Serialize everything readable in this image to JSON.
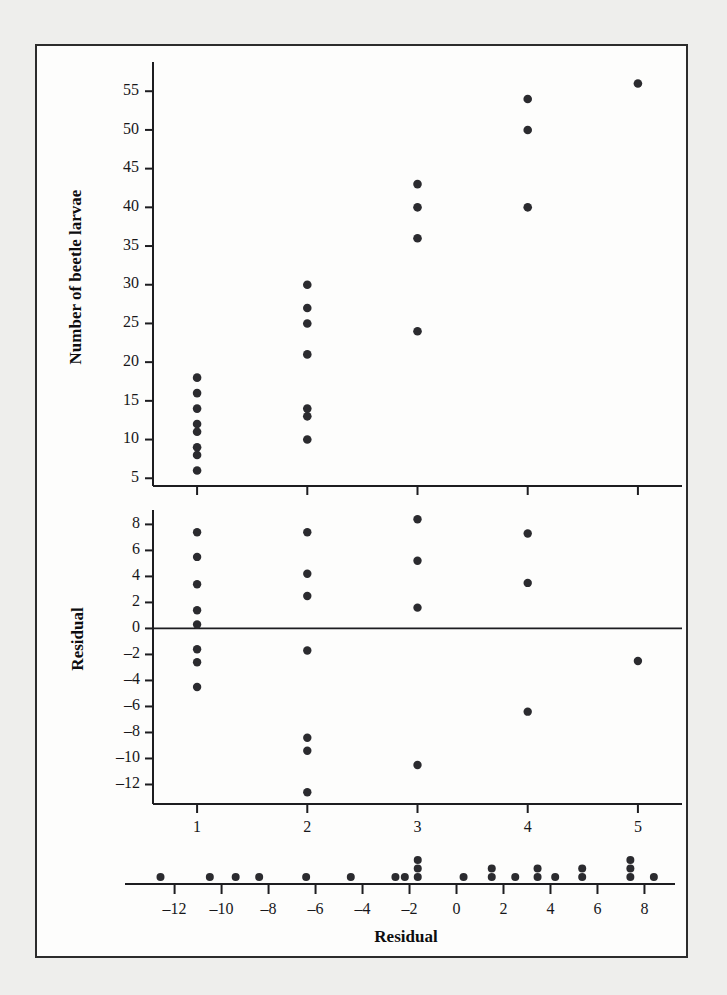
{
  "figure": {
    "background_color": "#eeeeec",
    "panel_color": "#fdfdfc",
    "border_color": "#2c2c2c",
    "marker_color": "#2b2b2f"
  },
  "chart_data": [
    {
      "type": "scatter",
      "title": "",
      "xlabel": "Number of stumps",
      "ylabel": "Number of beetle larvae",
      "xlim": [
        0.6,
        5.4
      ],
      "ylim": [
        4,
        58
      ],
      "xticks": [
        1,
        2,
        3,
        4,
        5
      ],
      "xticklabels": [
        "1",
        "2",
        "3",
        "4",
        "5"
      ],
      "yticks": [
        5,
        10,
        15,
        20,
        25,
        30,
        35,
        40,
        45,
        50,
        55
      ],
      "yticklabels": [
        "5",
        "10",
        "15",
        "20",
        "25",
        "30",
        "35",
        "40",
        "45",
        "50",
        "55"
      ],
      "grid": false,
      "legend": "none",
      "points": [
        {
          "x": 1,
          "y": 18
        },
        {
          "x": 1,
          "y": 16
        },
        {
          "x": 1,
          "y": 14
        },
        {
          "x": 1,
          "y": 12
        },
        {
          "x": 1,
          "y": 11
        },
        {
          "x": 1,
          "y": 9
        },
        {
          "x": 1,
          "y": 8
        },
        {
          "x": 1,
          "y": 6
        },
        {
          "x": 2,
          "y": 30
        },
        {
          "x": 2,
          "y": 27
        },
        {
          "x": 2,
          "y": 25
        },
        {
          "x": 2,
          "y": 21
        },
        {
          "x": 2,
          "y": 14
        },
        {
          "x": 2,
          "y": 13
        },
        {
          "x": 2,
          "y": 10
        },
        {
          "x": 3,
          "y": 43
        },
        {
          "x": 3,
          "y": 40
        },
        {
          "x": 3,
          "y": 36
        },
        {
          "x": 3,
          "y": 24
        },
        {
          "x": 4,
          "y": 54
        },
        {
          "x": 4,
          "y": 50
        },
        {
          "x": 4,
          "y": 40
        },
        {
          "x": 5,
          "y": 56
        }
      ]
    },
    {
      "type": "scatter",
      "title": "",
      "xlabel": "Number of stumps",
      "ylabel": "Residual",
      "xlim": [
        0.6,
        5.4
      ],
      "ylim": [
        -13.5,
        8.8
      ],
      "xticks": [
        1,
        2,
        3,
        4,
        5
      ],
      "xticklabels": [
        "1",
        "2",
        "3",
        "4",
        "5"
      ],
      "yticks": [
        8,
        6,
        4,
        2,
        0,
        -2,
        -4,
        -6,
        -8,
        -10,
        -12
      ],
      "yticklabels": [
        "8",
        "6",
        "4",
        "2",
        "0",
        "–2",
        "–4",
        "–6",
        "–8",
        "–10",
        "–12"
      ],
      "zero_line": 0,
      "grid": false,
      "legend": "none",
      "points": [
        {
          "x": 1,
          "y": 7.4
        },
        {
          "x": 1,
          "y": 5.5
        },
        {
          "x": 1,
          "y": 3.4
        },
        {
          "x": 1,
          "y": 1.4
        },
        {
          "x": 1,
          "y": 0.3
        },
        {
          "x": 1,
          "y": -1.6
        },
        {
          "x": 1,
          "y": -2.6
        },
        {
          "x": 1,
          "y": -4.5
        },
        {
          "x": 2,
          "y": 7.4
        },
        {
          "x": 2,
          "y": 4.2
        },
        {
          "x": 2,
          "y": 2.5
        },
        {
          "x": 2,
          "y": -1.7
        },
        {
          "x": 2,
          "y": -8.4
        },
        {
          "x": 2,
          "y": -9.4
        },
        {
          "x": 2,
          "y": -12.6
        },
        {
          "x": 3,
          "y": 8.4
        },
        {
          "x": 3,
          "y": 5.2
        },
        {
          "x": 3,
          "y": 1.6
        },
        {
          "x": 3,
          "y": -10.5
        },
        {
          "x": 4,
          "y": 7.3
        },
        {
          "x": 4,
          "y": 3.5
        },
        {
          "x": 4,
          "y": -6.4
        },
        {
          "x": 5,
          "y": -2.5
        }
      ]
    },
    {
      "type": "dotplot",
      "title": "",
      "xlabel": "Residual",
      "ylabel": "",
      "xlim": [
        -13.6,
        9.3
      ],
      "xticks": [
        -12,
        -10,
        -8,
        -6,
        -4,
        -2,
        0,
        2,
        4,
        6,
        8
      ],
      "xticklabels": [
        "–12",
        "–10",
        "–8",
        "–6",
        "–4",
        "–2",
        "0",
        "2",
        "4",
        "6",
        "8"
      ],
      "grid": false,
      "legend": "none",
      "values": [
        -12.6,
        -10.5,
        -9.4,
        -8.4,
        -6.4,
        -4.5,
        -2.6,
        -2.5,
        -1.7,
        -1.6,
        -1.6,
        0.3,
        1.4,
        1.6,
        2.5,
        3.4,
        3.5,
        4.2,
        5.2,
        5.5,
        7.3,
        7.4,
        7.4,
        7.4,
        8.4
      ],
      "stacks": [
        {
          "value": -12.6,
          "count": 1
        },
        {
          "value": -10.5,
          "count": 1
        },
        {
          "value": -9.4,
          "count": 1
        },
        {
          "value": -8.4,
          "count": 1
        },
        {
          "value": -6.4,
          "count": 1
        },
        {
          "value": -4.5,
          "count": 1
        },
        {
          "value": -2.6,
          "count": 1
        },
        {
          "value": -2.2,
          "count": 1
        },
        {
          "value": -1.65,
          "count": 3
        },
        {
          "value": 0.3,
          "count": 1
        },
        {
          "value": 1.5,
          "count": 2
        },
        {
          "value": 2.5,
          "count": 1
        },
        {
          "value": 3.45,
          "count": 2
        },
        {
          "value": 4.2,
          "count": 1
        },
        {
          "value": 5.35,
          "count": 2
        },
        {
          "value": 7.4,
          "count": 3
        },
        {
          "value": 8.4,
          "count": 1
        }
      ]
    }
  ]
}
